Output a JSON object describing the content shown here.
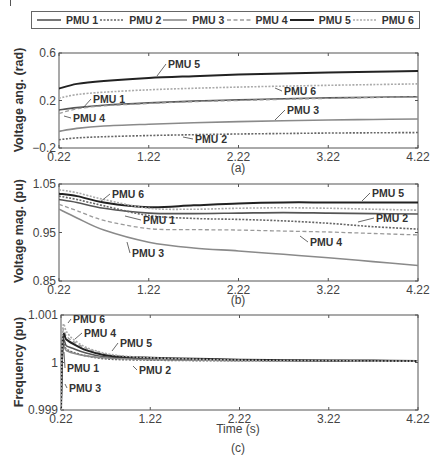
{
  "legend": {
    "items": [
      {
        "label": "PMU 1",
        "style": "solid",
        "color": "#555555",
        "width": 1.6
      },
      {
        "label": "PMU 2",
        "style": "dotted",
        "color": "#666666",
        "width": 1.6
      },
      {
        "label": "PMU 3",
        "style": "solid",
        "color": "#8a8a8a",
        "width": 1.6
      },
      {
        "label": "PMU 4",
        "style": "dashed",
        "color": "#9a9a9a",
        "width": 1.3
      },
      {
        "label": "PMU 5",
        "style": "solid",
        "color": "#222222",
        "width": 2.0
      },
      {
        "label": "PMU 6",
        "style": "dotted",
        "color": "#aaaaaa",
        "width": 1.6
      }
    ]
  },
  "chart_data": [
    {
      "panel": "(a)",
      "type": "line",
      "title": "",
      "xlabel": "",
      "ylabel": "Voltage ang. (rad)",
      "xlim": [
        0.22,
        4.22
      ],
      "ylim": [
        -0.2,
        0.6
      ],
      "xticks": [
        "0.22",
        "1.22",
        "2.22",
        "3.22",
        "4.22"
      ],
      "yticks": [
        "−0.2",
        "0.2",
        "0.6"
      ],
      "ytick_values": [
        -0.2,
        0.2,
        0.6
      ],
      "grid": false,
      "x": [
        0.22,
        0.42,
        0.72,
        1.22,
        1.72,
        2.22,
        2.72,
        3.22,
        3.72,
        4.22
      ],
      "series": [
        {
          "name": "PMU 1",
          "values": [
            0.12,
            0.14,
            0.16,
            0.18,
            0.195,
            0.205,
            0.215,
            0.222,
            0.228,
            0.232
          ]
        },
        {
          "name": "PMU 2",
          "values": [
            -0.13,
            -0.115,
            -0.105,
            -0.095,
            -0.088,
            -0.082,
            -0.078,
            -0.074,
            -0.072,
            -0.07
          ]
        },
        {
          "name": "PMU 3",
          "values": [
            -0.06,
            -0.035,
            -0.015,
            0.0,
            0.012,
            0.022,
            0.03,
            0.036,
            0.04,
            0.044
          ]
        },
        {
          "name": "PMU 4",
          "values": [
            0.09,
            0.13,
            0.155,
            0.175,
            0.19,
            0.2,
            0.21,
            0.218,
            0.225,
            0.23
          ]
        },
        {
          "name": "PMU 5",
          "values": [
            0.3,
            0.34,
            0.365,
            0.39,
            0.405,
            0.418,
            0.428,
            0.436,
            0.442,
            0.448
          ]
        },
        {
          "name": "PMU 6",
          "values": [
            0.22,
            0.25,
            0.27,
            0.29,
            0.303,
            0.313,
            0.321,
            0.328,
            0.334,
            0.34
          ]
        }
      ],
      "annotations": [
        {
          "text": "PMU 5",
          "series": "PMU 5"
        },
        {
          "text": "PMU 6",
          "series": "PMU 6"
        },
        {
          "text": "PMU 1",
          "series": "PMU 1"
        },
        {
          "text": "PMU 3",
          "series": "PMU 3"
        },
        {
          "text": "PMU 4",
          "series": "PMU 4"
        },
        {
          "text": "PMU 2",
          "series": "PMU 2"
        }
      ]
    },
    {
      "panel": "(b)",
      "type": "line",
      "title": "",
      "xlabel": "",
      "ylabel": "Voltage mag. (pu)",
      "xlim": [
        0.22,
        4.22
      ],
      "ylim": [
        0.85,
        1.05
      ],
      "xticks": [
        "0.22",
        "1.22",
        "2.22",
        "3.22",
        "4.22"
      ],
      "yticks": [
        "0.85",
        "0.95",
        "1.05"
      ],
      "ytick_values": [
        0.85,
        0.95,
        1.05
      ],
      "grid": false,
      "x": [
        0.22,
        0.42,
        0.72,
        1.22,
        1.72,
        2.22,
        2.72,
        3.22,
        3.72,
        4.22
      ],
      "series": [
        {
          "name": "PMU 1",
          "values": [
            1.018,
            1.012,
            1.0,
            0.99,
            0.989,
            0.99,
            0.991,
            0.99,
            0.989,
            0.988
          ]
        },
        {
          "name": "PMU 2",
          "values": [
            1.025,
            1.018,
            1.005,
            0.985,
            0.979,
            0.977,
            0.974,
            0.969,
            0.962,
            0.957
          ]
        },
        {
          "name": "PMU 3",
          "values": [
            0.998,
            0.98,
            0.955,
            0.93,
            0.918,
            0.912,
            0.905,
            0.898,
            0.89,
            0.882
          ]
        },
        {
          "name": "PMU 4",
          "values": [
            1.008,
            0.995,
            0.975,
            0.958,
            0.956,
            0.955,
            0.953,
            0.951,
            0.948,
            0.945
          ]
        },
        {
          "name": "PMU 5",
          "values": [
            1.03,
            1.025,
            1.012,
            1.002,
            1.006,
            1.01,
            1.012,
            1.012,
            1.012,
            1.012
          ]
        },
        {
          "name": "PMU 6",
          "values": [
            1.038,
            1.032,
            1.018,
            1.0,
            0.998,
            1.0,
            1.001,
            1.0,
            0.998,
            0.996
          ]
        }
      ],
      "annotations": [
        {
          "text": "PMU 6",
          "series": "PMU 6"
        },
        {
          "text": "PMU 1",
          "series": "PMU 1"
        },
        {
          "text": "PMU 3",
          "series": "PMU 3"
        },
        {
          "text": "PMU 5",
          "series": "PMU 5"
        },
        {
          "text": "PMU 2",
          "series": "PMU 2"
        },
        {
          "text": "PMU 4",
          "series": "PMU 4"
        }
      ]
    },
    {
      "panel": "(c)",
      "type": "line",
      "title": "",
      "xlabel": "Time (s)",
      "ylabel": "Frequency (pu)",
      "xlim": [
        0.22,
        4.22
      ],
      "ylim": [
        0.999,
        1.001
      ],
      "xticks": [
        "0.22",
        "1.22",
        "2.22",
        "3.22",
        "4.22"
      ],
      "yticks": [
        "0.999",
        "1",
        "1.001"
      ],
      "ytick_values": [
        0.999,
        1.0,
        1.001
      ],
      "grid": false,
      "x": [
        0.22,
        0.24,
        0.28,
        0.35,
        0.5,
        0.7,
        0.9,
        1.22,
        1.72,
        2.22,
        2.72,
        3.22,
        3.72,
        4.22
      ],
      "series": [
        {
          "name": "PMU 1",
          "values": [
            0.999,
            1.0004,
            1.00035,
            1.0003,
            1.0002,
            1.00012,
            1.0001,
            1.00008,
            1.00006,
            1.00005,
            1.00004,
            1.00004,
            1.00003,
            1.00003
          ]
        },
        {
          "name": "PMU 2",
          "values": [
            0.999,
            1.0003,
            1.00028,
            1.00022,
            1.00014,
            1.00008,
            1.00006,
            1.00005,
            1.00004,
            1.00004,
            1.00003,
            1.00003,
            1.00003,
            1.00003
          ]
        },
        {
          "name": "PMU 3",
          "values": [
            0.999,
            1.00025,
            1.00025,
            1.0002,
            1.00014,
            1.0001,
            1.00008,
            1.00006,
            1.00005,
            1.00004,
            1.00004,
            1.00003,
            1.00003,
            1.00003
          ]
        },
        {
          "name": "PMU 4",
          "values": [
            0.999,
            1.0006,
            1.00055,
            1.00045,
            1.0003,
            1.00018,
            1.00012,
            1.00009,
            1.00007,
            1.00005,
            1.00004,
            1.00004,
            1.00003,
            1.00003
          ]
        },
        {
          "name": "PMU 5",
          "values": [
            0.999,
            1.0005,
            1.00048,
            1.0004,
            1.00026,
            1.00016,
            1.00012,
            1.0001,
            1.00008,
            1.00006,
            1.00005,
            1.00004,
            1.00004,
            1.00003
          ]
        },
        {
          "name": "PMU 6",
          "values": [
            0.999,
            1.0007,
            1.00065,
            1.0005,
            1.00032,
            1.0002,
            1.00014,
            1.0001,
            1.00007,
            1.00005,
            1.00004,
            1.00004,
            1.00003,
            1.00003
          ]
        }
      ],
      "annotations": [
        {
          "text": "PMU 6",
          "series": "PMU 6"
        },
        {
          "text": "PMU 4",
          "series": "PMU 4"
        },
        {
          "text": "PMU 5",
          "series": "PMU 5"
        },
        {
          "text": "PMU 1",
          "series": "PMU 1"
        },
        {
          "text": "PMU 2",
          "series": "PMU 2"
        },
        {
          "text": "PMU 3",
          "series": "PMU 3"
        }
      ]
    }
  ],
  "panels": {
    "a": {
      "label": "(a)",
      "ylabel": "Voltage ang. (rad)"
    },
    "b": {
      "label": "(b)",
      "ylabel": "Voltage mag. (pu)"
    },
    "c": {
      "label": "(c)",
      "ylabel": "Frequency (pu)",
      "xlabel": "Time (s)"
    }
  }
}
